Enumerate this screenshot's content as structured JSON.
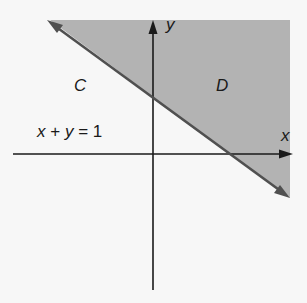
{
  "diagram": {
    "type": "half-plane region diagram",
    "colors": {
      "background": "#f7f7f7",
      "shaded_region": "#b3b3b3",
      "boundary_line": "#505050",
      "axes": "#1a1a1a",
      "text": "#1a1a1a"
    },
    "axes": {
      "x_label": "x",
      "y_label": "y"
    },
    "line": {
      "equation_label": "x + y = 1",
      "equation_parts": [
        "x",
        "+",
        "y",
        "=",
        "1"
      ]
    },
    "regions": [
      {
        "label": "C",
        "shaded": false,
        "description": "below-left of line"
      },
      {
        "label": "D",
        "shaded": true,
        "description": "above-right of line"
      }
    ]
  }
}
